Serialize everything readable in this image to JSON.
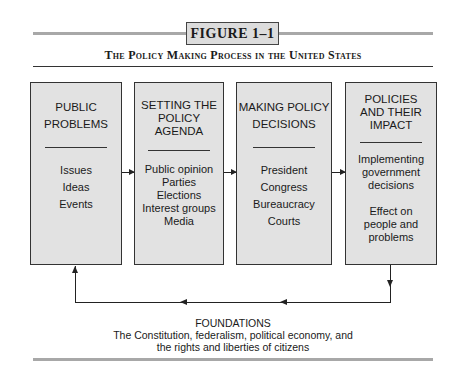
{
  "figure": {
    "label": "FIGURE 1–1",
    "title": "The Policy Making Process in the United States"
  },
  "stages": [
    {
      "heading_lines": [
        "PUBLIC",
        "PROBLEMS"
      ],
      "items": [
        "Issues",
        "Ideas",
        "Events"
      ]
    },
    {
      "heading_lines": [
        "SETTING THE",
        "POLICY AGENDA"
      ],
      "items": [
        "Public opinion",
        "Parties",
        "Elections",
        "Interest groups",
        "Media"
      ]
    },
    {
      "heading_lines": [
        "MAKING POLICY",
        "DECISIONS"
      ],
      "items": [
        "President",
        "Congress",
        "Bureaucracy",
        "Courts"
      ]
    },
    {
      "heading_lines": [
        "POLICIES",
        "AND THEIR",
        "IMPACT"
      ],
      "items": [
        "Implementing",
        "government",
        "decisions",
        "",
        "Effect on",
        "people and",
        "problems"
      ]
    }
  ],
  "foundations": {
    "heading": "FOUNDATIONS",
    "line1": "The Constitution, federalism, political economy, and",
    "line2": "the rights and liberties of citizens"
  },
  "colors": {
    "box_fill": "#e2e2e2",
    "label_fill": "#dcdcdc",
    "rule_grey": "#a8a8a8",
    "ink": "#1a1a1a"
  }
}
